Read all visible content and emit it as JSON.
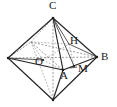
{
  "figure": {
    "kind": "geometry-diagram",
    "shape": "octahedron",
    "background_color": "#ffffff",
    "line_color": "#232323",
    "hidden_line_color": "#707070",
    "label_color": "#1a1a1a",
    "labels": [
      {
        "id": "C",
        "text": "C",
        "x": 49,
        "y": 0,
        "role": "apex-vertex"
      },
      {
        "id": "H",
        "text": "H",
        "x": 70,
        "y": 35,
        "role": "foot-of-perpendicular"
      },
      {
        "id": "B",
        "text": "B",
        "x": 101,
        "y": 51,
        "role": "right-vertex"
      },
      {
        "id": "M",
        "text": "M",
        "x": 78,
        "y": 63,
        "role": "midpoint"
      },
      {
        "id": "A",
        "text": "A",
        "x": 60,
        "y": 70,
        "role": "front-vertex"
      },
      {
        "id": "O",
        "text": "O",
        "x": 35,
        "y": 56,
        "role": "center"
      }
    ],
    "points": {
      "C": {
        "x": 53,
        "y": 18
      },
      "D": {
        "x": 53,
        "y": 100
      },
      "left": {
        "x": 8,
        "y": 58
      },
      "B": {
        "x": 97,
        "y": 57
      },
      "A": {
        "x": 63,
        "y": 70
      },
      "back": {
        "x": 31,
        "y": 42
      },
      "O": {
        "x": 43,
        "y": 60
      },
      "H": {
        "x": 69,
        "y": 44
      },
      "M": {
        "x": 74,
        "y": 66
      }
    }
  }
}
